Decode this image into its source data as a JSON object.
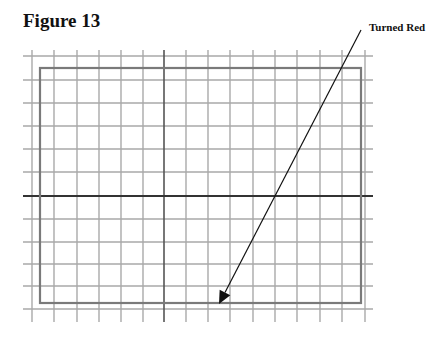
{
  "figure": {
    "title": "Figure 13",
    "annotation": "Turned Red"
  },
  "grid": {
    "vertical_lines_x": [
      32,
      54,
      77,
      99,
      121,
      143,
      164,
      186,
      208,
      230,
      253,
      275,
      297,
      320,
      342,
      365
    ],
    "horizontal_lines_y": [
      56,
      80,
      103,
      126,
      149,
      172,
      196,
      219,
      242,
      264,
      286,
      309
    ],
    "x_extent": [
      23,
      373
    ],
    "y_extent": [
      50,
      322
    ],
    "axis_x": 164,
    "axis_y": 196,
    "grid_color": "#a9a9a9",
    "axis_color": "#333333"
  },
  "rectangle": {
    "x": 40,
    "y": 68,
    "width": 321,
    "height": 235,
    "color": "#7a7a7a"
  },
  "arrow": {
    "x1": 361,
    "y1": 30,
    "x2": 219,
    "y2": 304,
    "color": "#111111"
  }
}
